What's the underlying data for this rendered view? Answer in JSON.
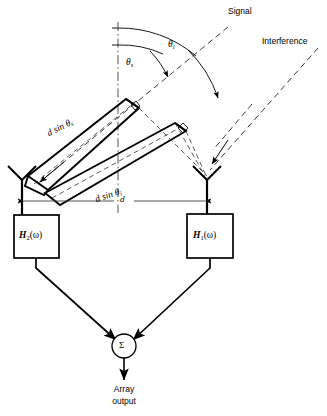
{
  "figure": {
    "type": "diagram"
  },
  "labels": {
    "signal": "Signal",
    "interference": "Interference",
    "theta_signal_glyph": "θ",
    "theta_signal_sub": "s",
    "theta_interference_glyph": "θ",
    "theta_interference_sub": "i",
    "d_sin_theta_s_prefix": "d sin θ",
    "d_sin_theta_s_sub": "s",
    "d_sin_theta_i_prefix": "d sin θ",
    "d_sin_theta_i_sub": "i",
    "spacing": "d",
    "filter_left_main": "H",
    "filter_left_sub": "2",
    "filter_left_arg": "(ω)",
    "filter_right_main": "H",
    "filter_right_sub": "1",
    "filter_right_arg": "(ω)",
    "summer": "Σ",
    "output_line1": "Array",
    "output_line2": "output"
  },
  "geometry": {
    "reference_axis_x": 118,
    "element_left_x": 22,
    "element_right_x": 207,
    "element_y": 201,
    "spacing_label_x": 124,
    "summer_cx": 124,
    "summer_cy": 346,
    "summer_r": 12,
    "theta_s_degrees": 27,
    "theta_i_degrees": 52
  },
  "colors": {
    "ink": "#000000",
    "background": "#ffffff",
    "dimension_line": "#555555"
  }
}
